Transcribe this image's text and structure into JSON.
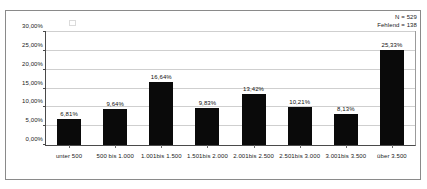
{
  "annotations": {
    "n_label": "N = 529",
    "missing_label": "Fehlend = 138"
  },
  "chart_data": {
    "type": "bar",
    "title": "",
    "subtitle": "",
    "xlabel": "",
    "ylabel": "",
    "grid": true,
    "legend": false,
    "ylim": [
      0,
      30
    ],
    "yticks": [
      "0,00%",
      "5,00%",
      "10,00%",
      "15,00%",
      "20,00%",
      "25,00%",
      "30,00%"
    ],
    "ytick_values": [
      0,
      5,
      10,
      15,
      20,
      25,
      30
    ],
    "categories": [
      "unter 500",
      "500 bis 1.000",
      "1.001bis 1.500",
      "1.501bis 2.000",
      "2.001bis 2.500",
      "2.501bis 3.000",
      "3.001bis 3.500",
      "über 3.500"
    ],
    "values": [
      6.81,
      9.64,
      16.64,
      9.83,
      13.42,
      10.21,
      8.13,
      25.33
    ],
    "data_labels": [
      "6,81%",
      "9,64%",
      "16,64%",
      "9,83%",
      "13,42%",
      "10,21%",
      "8,13%",
      "25,33%"
    ],
    "bar_color": "#0a0a0a",
    "grid_color": "#cfcfcf",
    "axis_color": "#4a4a4a"
  }
}
